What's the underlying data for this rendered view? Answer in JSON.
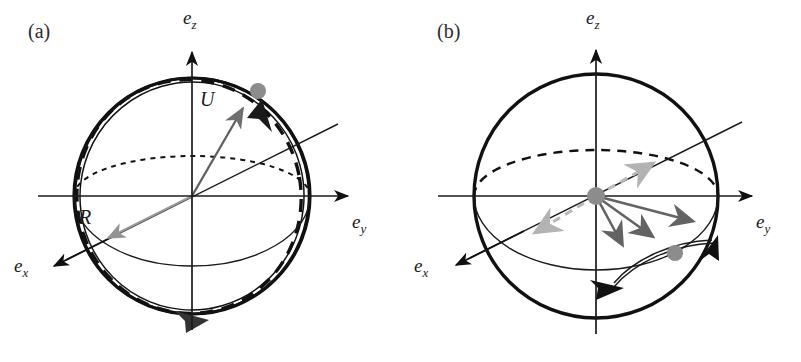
{
  "figure": {
    "width": 801,
    "height": 362,
    "background": "#ffffff",
    "type": "scientific-diagram"
  },
  "colors": {
    "stroke_black": "#111111",
    "stroke_dark_gray": "#555555",
    "arrow_gray": "#6e6e6e",
    "arrow_light_gray": "#b3b3b3",
    "dot_gray": "#8c8c8c",
    "thin_line": "#1a1a1a",
    "background": "#ffffff"
  },
  "panels": [
    {
      "id": "a",
      "label": "(a)",
      "label_x": 28,
      "label_y": 38,
      "center": {
        "x": 192,
        "y": 196
      },
      "radius": 118,
      "axes": [
        {
          "name": "e_z",
          "base": "e",
          "sub": "z",
          "label_x": 183,
          "label_y": 24,
          "dir": "up"
        },
        {
          "name": "e_y",
          "base": "e",
          "sub": "y",
          "label_x": 352,
          "label_y": 228,
          "dir": "right"
        },
        {
          "name": "e_x",
          "base": "e",
          "sub": "x",
          "label_x": 14,
          "label_y": 272,
          "dir": "lower-left"
        }
      ],
      "vectors": [
        {
          "name": "U",
          "label": "U",
          "label_x": 200,
          "label_y": 106,
          "color": "#6e6e6e",
          "from": [
            192,
            196
          ],
          "to": [
            248,
            100
          ]
        },
        {
          "name": "R",
          "label": "R",
          "label_x": 79,
          "label_y": 224,
          "color": "#8c8c8c",
          "from": [
            192,
            196
          ],
          "to": [
            100,
            242
          ]
        }
      ],
      "marker_dot": {
        "x": 258,
        "y": 91,
        "r": 8,
        "color": "#8c8c8c"
      },
      "tilt_axis_angle_deg": -26,
      "great_circle_tilt_deg": 8,
      "elements": [
        "main-circle",
        "dashed-tilted-great-circle",
        "thick-orbit-ring",
        "upper-dotted-equator-arc",
        "lower-solid-equator-arc",
        "tilted-axis-line",
        "orbit-arrowhead-top-right",
        "orbit-arrowhead-bottom"
      ]
    },
    {
      "id": "b",
      "label": "(b)",
      "label_x": 37,
      "label_y": 38,
      "center": {
        "x": 196,
        "y": 196
      },
      "radius": 122,
      "axes": [
        {
          "name": "e_z",
          "base": "e",
          "sub": "z",
          "label_x": 186,
          "label_y": 24,
          "dir": "up"
        },
        {
          "name": "e_y",
          "base": "e",
          "sub": "y",
          "label_x": 356,
          "label_y": 228,
          "dir": "right"
        },
        {
          "name": "e_x",
          "base": "e",
          "sub": "x",
          "label_x": 14,
          "label_y": 272,
          "dir": "lower-left"
        }
      ],
      "center_dot": {
        "x": 196,
        "y": 196,
        "r": 9,
        "color": "#8c8c8c"
      },
      "marker_dot": {
        "x": 275,
        "y": 253,
        "r": 8,
        "color": "#8c8c8c"
      },
      "fan_vectors": [
        {
          "name": "fan-1",
          "color": "#6e6e6e",
          "from": [
            196,
            196
          ],
          "to": [
            228,
            252
          ]
        },
        {
          "name": "fan-2",
          "color": "#6e6e6e",
          "from": [
            196,
            196
          ],
          "to": [
            260,
            243
          ]
        },
        {
          "name": "fan-3",
          "color": "#6e6e6e",
          "from": [
            196,
            196
          ],
          "to": [
            300,
            227
          ]
        }
      ],
      "dashed_vectors": [
        {
          "name": "dashed-up-right",
          "color": "#b3b3b3",
          "from": [
            196,
            196
          ],
          "to": [
            258,
            161
          ]
        },
        {
          "name": "dashed-down-left",
          "color": "#b3b3b3",
          "from": [
            196,
            196
          ],
          "to": [
            128,
            236
          ]
        }
      ],
      "tilt_axis_angle_deg": -26,
      "elements": [
        "main-circle",
        "upper-dashed-equator-arc",
        "lower-solid-equator-arc",
        "tilted-axis-line",
        "fan-vectors",
        "dashed-vectors",
        "trajectory-arc",
        "trajectory-arrowheads"
      ]
    }
  ]
}
